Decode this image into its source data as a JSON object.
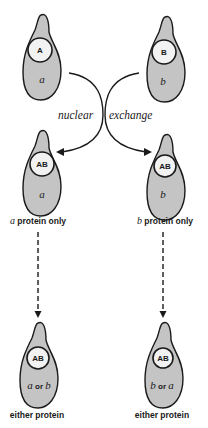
{
  "diagram": {
    "exchange_label_left": "nuclear",
    "exchange_label_right": "exchange",
    "colors": {
      "cytoplasm": "#c4c4c4",
      "nucleus": "#f2f2f2",
      "outline": "#1a1a1a",
      "background": "#ffffff"
    },
    "top_row": [
      {
        "nucleus": "A",
        "cytoplasm": "a"
      },
      {
        "nucleus": "B",
        "cytoplasm": "b"
      }
    ],
    "middle_row": [
      {
        "nucleus": "AB",
        "cytoplasm": "a",
        "caption_italic": "a",
        "caption_rest": " protein only"
      },
      {
        "nucleus": "AB",
        "cytoplasm": "b",
        "caption_italic": "b",
        "caption_rest": " protein only"
      }
    ],
    "bottom_row": [
      {
        "nucleus": "AB",
        "cyto_first": "a",
        "cyto_or": " or ",
        "cyto_second": "b",
        "caption": "either protein"
      },
      {
        "nucleus": "AB",
        "cyto_first": "b",
        "cyto_or": " or ",
        "cyto_second": "a",
        "caption": "either protein"
      }
    ]
  }
}
